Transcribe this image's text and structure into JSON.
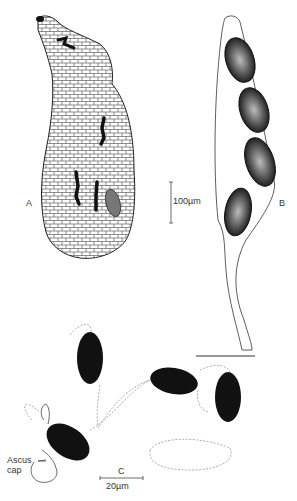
{
  "figure": {
    "panels": [
      {
        "id": "A",
        "label": "A",
        "subject": "perithecium",
        "scale_bar": "100µm"
      },
      {
        "id": "B",
        "label": "B",
        "subject": "ascus with four ascospores"
      },
      {
        "id": "C",
        "label": "C",
        "subject": "discharged ascospores with ascus cap",
        "scale_bar": "20µm"
      }
    ],
    "annotations": {
      "ascus_cap_line1": "Ascus",
      "ascus_cap_line2": "cap"
    },
    "colors": {
      "ink": "#111111",
      "stipple": "#555555",
      "dashed": "#999999",
      "background": "#ffffff"
    }
  }
}
